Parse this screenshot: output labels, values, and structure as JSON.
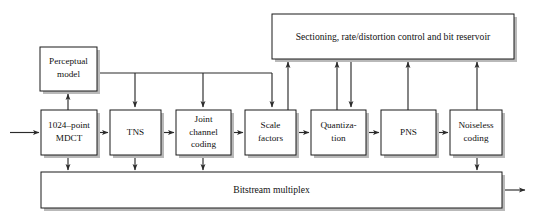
{
  "diagram": {
    "canvas": {
      "width": 534,
      "height": 222
    },
    "colors": {
      "background": "#ffffff",
      "box_stroke": "#1a1a1a",
      "box_fill": "#ffffff",
      "connector": "#2b2b2b",
      "shadow": "#b9b9b9",
      "text": "#111111"
    },
    "blocks": {
      "sectioning": {
        "label": "Sectioning, rate/distortion control and bit reservoir",
        "x": 272,
        "y": 14,
        "w": 242,
        "h": 45
      },
      "perceptual": {
        "line1": "Perceptual",
        "line2": "model",
        "x": 40,
        "y": 47,
        "w": 57,
        "h": 44
      },
      "mdct": {
        "line1": "1024–point",
        "line2": "MDCT",
        "x": 41,
        "y": 110,
        "w": 56,
        "h": 45
      },
      "tns": {
        "line1": "TNS",
        "line2": "",
        "x": 110,
        "y": 110,
        "w": 51,
        "h": 45
      },
      "joint": {
        "line1": "Joint",
        "line2": "channel",
        "line3": "coding",
        "x": 176,
        "y": 110,
        "w": 55,
        "h": 45
      },
      "scalefactors": {
        "line1": "Scale",
        "line2": "factors",
        "x": 245,
        "y": 110,
        "w": 51,
        "h": 45
      },
      "quantization": {
        "line1": "Quantiza-",
        "line2": "tion",
        "x": 311,
        "y": 110,
        "w": 55,
        "h": 45
      },
      "pns": {
        "line1": "PNS",
        "line2": "",
        "x": 381,
        "y": 110,
        "w": 55,
        "h": 45
      },
      "noiseless": {
        "line1": "Noiseless",
        "line2": "coding",
        "x": 450,
        "y": 110,
        "w": 52,
        "h": 45
      },
      "bitstream": {
        "label": "Bitstream multiplex",
        "x": 41,
        "y": 172,
        "w": 461,
        "h": 36
      }
    },
    "connectors": [
      {
        "name": "input-arrow-to-mdct",
        "kind": "arrow"
      },
      {
        "name": "mdct-to-tns",
        "kind": "arrow"
      },
      {
        "name": "tns-to-joint",
        "kind": "arrow"
      },
      {
        "name": "joint-to-scalefactors",
        "kind": "arrow"
      },
      {
        "name": "scalefactors-to-quantization",
        "kind": "arrow"
      },
      {
        "name": "quantization-to-pns",
        "kind": "arrow"
      },
      {
        "name": "pns-to-noiseless",
        "kind": "arrow"
      },
      {
        "name": "mdct-to-perceptual-model",
        "kind": "arrow-up"
      },
      {
        "name": "perceptual-model-to-tns",
        "kind": "arrow-down"
      },
      {
        "name": "perceptual-model-to-joint",
        "kind": "arrow-down"
      },
      {
        "name": "perceptual-model-to-scalefactors",
        "kind": "arrow-down"
      },
      {
        "name": "scalefactors-to-sectioning",
        "kind": "arrow-up"
      },
      {
        "name": "quantization-to-sectioning",
        "kind": "arrow-up"
      },
      {
        "name": "sectioning-to-quantization",
        "kind": "arrow-down"
      },
      {
        "name": "pns-to-sectioning",
        "kind": "arrow-up"
      },
      {
        "name": "noiseless-to-sectioning",
        "kind": "arrow-up"
      },
      {
        "name": "mdct-to-bitstream",
        "kind": "arrow-down"
      },
      {
        "name": "tns-to-bitstream",
        "kind": "arrow-down"
      },
      {
        "name": "joint-to-bitstream",
        "kind": "arrow-down"
      },
      {
        "name": "noiseless-to-bitstream",
        "kind": "arrow-down"
      },
      {
        "name": "bitstream-output-arrow",
        "kind": "arrow"
      }
    ]
  }
}
